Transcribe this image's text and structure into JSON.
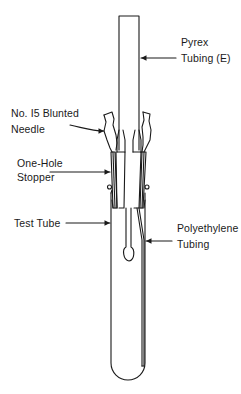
{
  "diagram": {
    "type": "apparatus-schematic",
    "line_color": "#1a1a1a",
    "background": "#ffffff",
    "labels": {
      "pyrex": {
        "line1": "Pyrex",
        "line2": "Tubing (E)"
      },
      "needle": {
        "line1": "No. I5 Blunted",
        "line2": "Needle"
      },
      "stopper": {
        "line1": "One-Hole",
        "line2": "Stopper"
      },
      "test_tube": {
        "line1": "Test Tube"
      },
      "polyethylene": {
        "line1": "Polyethylene",
        "line2": "Tubing"
      }
    },
    "components": [
      "Pyrex Tubing (E)",
      "No. I5 Blunted Needle",
      "One-Hole Stopper",
      "Test Tube",
      "Polyethylene Tubing"
    ]
  }
}
